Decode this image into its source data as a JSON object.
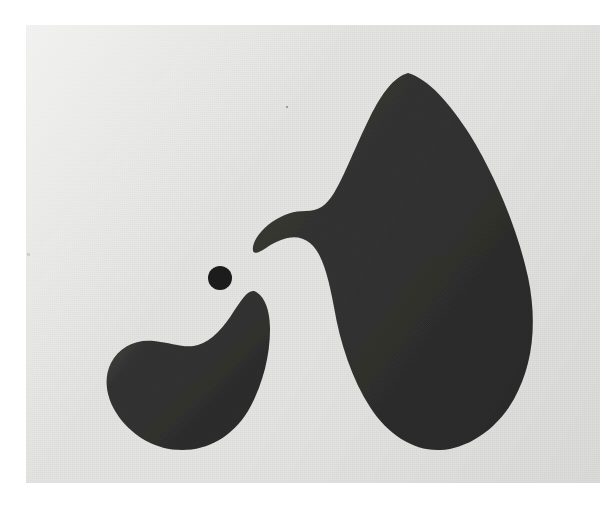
{
  "artwork": {
    "medium_note": "black-and-white photographic print",
    "subject": "abstract biomorphic relief with three dark shapes",
    "caption": "",
    "border": {
      "paper_color": "#ffffff",
      "print_left": 26,
      "print_top": 25,
      "print_width": 574,
      "print_height": 458
    },
    "palette": {
      "paper_white": "#ffffff",
      "print_ground": "#e4e4e1",
      "shape_black": "#1c1c1c",
      "shape_black_edge": "#2a2a28",
      "speck_gray": "#9a9a96"
    },
    "shapes": [
      {
        "name": "large-bird-form",
        "label": "large biomorphic form",
        "fill": "#1c1c1c",
        "bbox": [
          227,
          48,
          504,
          425
        ],
        "path": "M 382 48 C 402 54 424 78 444 110 C 470 152 492 206 502 252 C 512 300 506 342 488 374 C 470 406 440 424 414 425 C 388 426 362 410 344 382 C 326 354 314 318 308 282 C 302 250 296 228 284 218 C 272 208 256 212 240 223 C 230 230 226 229 227 222 C 228 214 236 204 246 197 C 258 189 268 186 280 186 C 292 186 300 181 308 168 C 318 152 330 120 344 92 C 356 68 368 52 382 48 Z"
      },
      {
        "name": "small-crescent-form",
        "label": "lower-left crescent form",
        "fill": "#1c1c1c",
        "bbox": [
          80,
          266,
          245,
          425
        ],
        "path": "M 228 266 C 238 270 244 284 244 304 C 244 332 236 362 222 386 C 206 412 182 425 156 425 C 130 425 108 412 93 392 C 80 374 77 354 85 338 C 93 322 110 314 128 316 C 146 318 160 324 172 320 C 186 316 198 302 208 286 C 216 274 222 265 228 266 Z"
      },
      {
        "name": "small-dot-form",
        "label": "small round dot",
        "fill": "#1c1c1c",
        "cx": 194,
        "cy": 253,
        "r": 12
      }
    ],
    "specks": [
      {
        "name": "speck-upper",
        "x": 286,
        "y": 106,
        "size": 2,
        "color": "#8d8d89"
      },
      {
        "name": "speck-left-margin",
        "x": 27,
        "y": 253,
        "size": 3,
        "color": "#b2b2ae"
      }
    ]
  }
}
